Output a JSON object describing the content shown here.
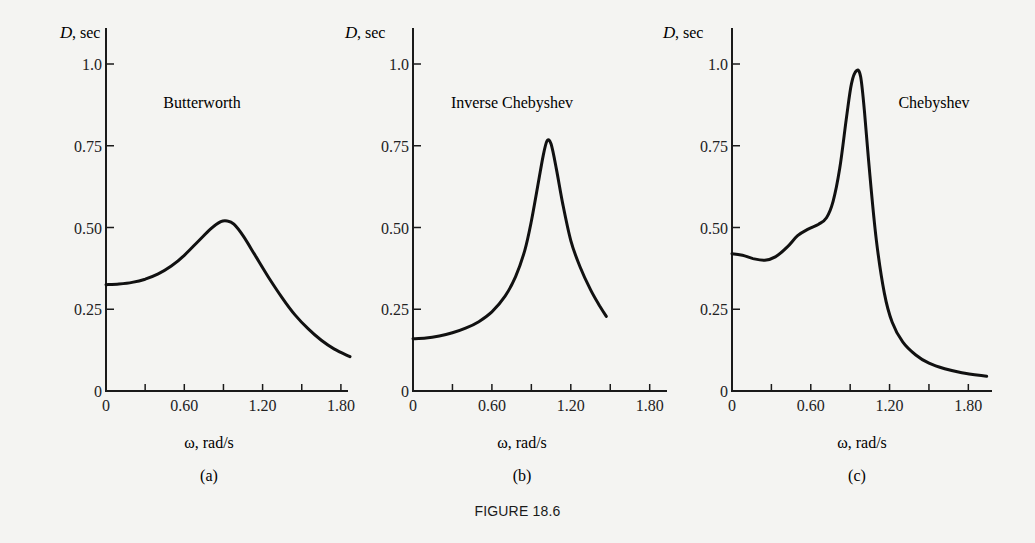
{
  "figure_caption": "FIGURE 18.6",
  "chart_data": [
    {
      "type": "line",
      "panel_label": "(a)",
      "title": "Butterworth",
      "xlabel": "ω, rad/s",
      "ylabel": "D, sec",
      "xlim": [
        0,
        1.9
      ],
      "ylim": [
        0,
        1.1
      ],
      "x_ticks": [
        0,
        0.3,
        0.6,
        0.9,
        1.2,
        1.5,
        1.8
      ],
      "x_tick_labels": [
        "0",
        "",
        "0.60",
        "",
        "1.20",
        "",
        "1.80"
      ],
      "y_ticks": [
        0,
        0.25,
        0.5,
        0.75,
        1.0
      ],
      "y_tick_labels": [
        "0",
        "0.25",
        "0.50",
        "0.75",
        "1.0"
      ],
      "grid": false,
      "series": [
        {
          "name": "Butterworth",
          "x": [
            0,
            0.1,
            0.2,
            0.3,
            0.4,
            0.5,
            0.6,
            0.7,
            0.8,
            0.88,
            0.93,
            0.98,
            1.05,
            1.15,
            1.25,
            1.35,
            1.45,
            1.55,
            1.65,
            1.75,
            1.87
          ],
          "y": [
            0.325,
            0.327,
            0.332,
            0.342,
            0.358,
            0.382,
            0.415,
            0.455,
            0.495,
            0.518,
            0.52,
            0.51,
            0.475,
            0.41,
            0.345,
            0.285,
            0.232,
            0.19,
            0.155,
            0.128,
            0.105
          ]
        }
      ]
    },
    {
      "type": "line",
      "panel_label": "(b)",
      "title": "Inverse Chebyshev",
      "xlabel": "ω, rad/s",
      "ylabel": "D, sec",
      "xlim": [
        0,
        1.9
      ],
      "ylim": [
        0,
        1.1
      ],
      "x_ticks": [
        0,
        0.3,
        0.6,
        0.9,
        1.2,
        1.5,
        1.8
      ],
      "x_tick_labels": [
        "0",
        "",
        "0.60",
        "",
        "1.20",
        "",
        "1.80"
      ],
      "y_ticks": [
        0,
        0.25,
        0.5,
        0.75,
        1.0
      ],
      "y_tick_labels": [
        "0",
        "0.25",
        "0.50",
        "0.75",
        "1.0"
      ],
      "grid": false,
      "series": [
        {
          "name": "Inverse Chebyshev",
          "x": [
            0,
            0.1,
            0.2,
            0.3,
            0.4,
            0.5,
            0.6,
            0.7,
            0.78,
            0.85,
            0.9,
            0.95,
            0.99,
            1.02,
            1.05,
            1.09,
            1.14,
            1.2,
            1.27,
            1.35,
            1.42,
            1.47
          ],
          "y": [
            0.16,
            0.162,
            0.168,
            0.178,
            0.192,
            0.212,
            0.242,
            0.29,
            0.35,
            0.43,
            0.52,
            0.63,
            0.72,
            0.765,
            0.755,
            0.68,
            0.57,
            0.46,
            0.38,
            0.31,
            0.26,
            0.228
          ]
        }
      ]
    },
    {
      "type": "line",
      "panel_label": "(c)",
      "title": "Chebyshev",
      "xlabel": "ω, rad/s",
      "ylabel": "D, sec",
      "xlim": [
        0,
        1.95
      ],
      "ylim": [
        0,
        1.1
      ],
      "x_ticks": [
        0,
        0.3,
        0.6,
        0.9,
        1.2,
        1.5,
        1.8
      ],
      "x_tick_labels": [
        "0",
        "",
        "0.60",
        "",
        "1.20",
        "",
        "1.80"
      ],
      "y_ticks": [
        0,
        0.25,
        0.5,
        0.75,
        1.0
      ],
      "y_tick_labels": [
        "0",
        "0.25",
        "0.50",
        "0.75",
        "1.0"
      ],
      "grid": false,
      "series": [
        {
          "name": "Chebyshev",
          "x": [
            0,
            0.08,
            0.16,
            0.25,
            0.33,
            0.42,
            0.5,
            0.58,
            0.66,
            0.72,
            0.77,
            0.82,
            0.87,
            0.91,
            0.95,
            0.98,
            1.01,
            1.05,
            1.1,
            1.16,
            1.22,
            1.3,
            1.4,
            1.5,
            1.62,
            1.75,
            1.94
          ],
          "y": [
            0.42,
            0.415,
            0.405,
            0.4,
            0.41,
            0.44,
            0.475,
            0.495,
            0.51,
            0.53,
            0.58,
            0.68,
            0.83,
            0.94,
            0.98,
            0.96,
            0.85,
            0.66,
            0.46,
            0.3,
            0.21,
            0.15,
            0.11,
            0.085,
            0.068,
            0.056,
            0.045
          ]
        }
      ]
    }
  ],
  "panels": [
    {
      "ylabel_italic": "D",
      "ylabel_rest": ", sec",
      "title": "Butterworth",
      "xlabel": "ω, rad/s",
      "label": "(a)"
    },
    {
      "ylabel_italic": "D",
      "ylabel_rest": ", sec",
      "title": "Inverse Chebyshev",
      "xlabel": "ω, rad/s",
      "label": "(b)"
    },
    {
      "ylabel_italic": "D",
      "ylabel_rest": ", sec",
      "title": "Chebyshev",
      "xlabel": "ω, rad/s",
      "label": "(c)"
    }
  ],
  "style": {
    "line_color": "#111111",
    "axis_color": "#1a1a1a",
    "background": "#f4f4f2"
  }
}
